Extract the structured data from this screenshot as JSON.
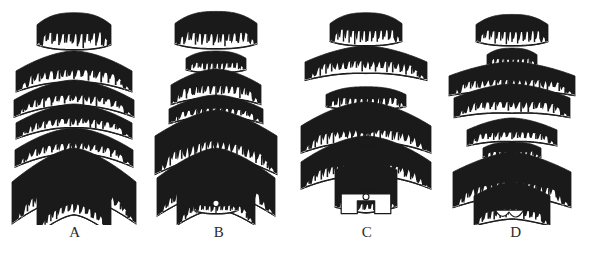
{
  "figure": {
    "kind": "scientific-line-illustration",
    "background_color": "#ffffff",
    "ink_color": "#1a1a1a",
    "enamel_color": "#ffffff",
    "width": 590,
    "height": 257,
    "label_row_y": 231
  },
  "panels": [
    {
      "id": "panel-a",
      "label": "A",
      "center_x": 74,
      "label_x_center": 74,
      "element_count": 7,
      "elements": [
        {
          "index": 1,
          "shape": "trapezoid-cap",
          "y": 10,
          "w": 74,
          "h": 40,
          "arch": 8,
          "teeth": 12,
          "tooth_depth": 17,
          "tilt": 0
        },
        {
          "index": 2,
          "shape": "wide-chevron",
          "y": 51,
          "w": 116,
          "h": 34,
          "arch": 20,
          "teeth": 17,
          "tooth_depth": 13,
          "tilt": 0
        },
        {
          "index": 3,
          "shape": "wide-chevron",
          "y": 80,
          "w": 120,
          "h": 28,
          "arch": 20,
          "teeth": 18,
          "tooth_depth": 11,
          "tilt": 0
        },
        {
          "index": 4,
          "shape": "wide-chevron",
          "y": 104,
          "w": 116,
          "h": 26,
          "arch": 19,
          "teeth": 18,
          "tooth_depth": 10,
          "tilt": 0
        },
        {
          "index": 5,
          "shape": "wide-chevron",
          "y": 128,
          "w": 118,
          "h": 28,
          "arch": 22,
          "teeth": 18,
          "tooth_depth": 11,
          "tilt": 0
        },
        {
          "index": 6,
          "shape": "deep-chevron",
          "y": 148,
          "w": 124,
          "h": 48,
          "arch": 34,
          "teeth": 20,
          "tooth_depth": 13,
          "tilt": 0
        },
        {
          "index": 7,
          "shape": "narrow-chevron",
          "y": 170,
          "w": 74,
          "h": 46,
          "arch": 26,
          "teeth": 13,
          "tooth_depth": 12,
          "tilt": 0
        }
      ]
    },
    {
      "id": "panel-b",
      "label": "B",
      "center_x": 216,
      "label_x_center": 216,
      "element_count": 8,
      "elements": [
        {
          "index": 1,
          "shape": "trapezoid-cap",
          "y": 9,
          "w": 82,
          "h": 40,
          "arch": 7,
          "teeth": 14,
          "tooth_depth": 16,
          "tilt": 0
        },
        {
          "index": 2,
          "shape": "low-cap",
          "y": 49,
          "w": 60,
          "h": 24,
          "arch": 6,
          "teeth": 12,
          "tooth_depth": 10,
          "tilt": 0
        },
        {
          "index": 3,
          "shape": "wide-chevron",
          "y": 69,
          "w": 90,
          "h": 32,
          "arch": 16,
          "teeth": 15,
          "tooth_depth": 13,
          "tilt": 0
        },
        {
          "index": 4,
          "shape": "wide-chevron",
          "y": 95,
          "w": 94,
          "h": 24,
          "arch": 14,
          "teeth": 15,
          "tooth_depth": 9,
          "tilt": 0
        },
        {
          "index": 5,
          "shape": "broad-arch",
          "y": 110,
          "w": 122,
          "h": 46,
          "arch": 26,
          "teeth": 20,
          "tooth_depth": 15,
          "tilt": 0
        },
        {
          "index": 6,
          "shape": "deep-chevron",
          "y": 148,
          "w": 118,
          "h": 44,
          "arch": 30,
          "teeth": 19,
          "tooth_depth": 13,
          "tilt": 0
        },
        {
          "index": 7,
          "shape": "narrow-arch",
          "y": 170,
          "w": 78,
          "h": 40,
          "arch": 22,
          "teeth": 14,
          "tooth_depth": 11,
          "tilt": 0
        },
        {
          "index": 8,
          "shape": "ring-arch",
          "y": 186,
          "w": 44,
          "h": 28,
          "arch": 12,
          "teeth": 9,
          "tooth_depth": 8,
          "tilt": 0,
          "inner_marking": "small-white-ring"
        }
      ]
    },
    {
      "id": "panel-c",
      "label": "C",
      "center_x": 366,
      "label_x_center": 366,
      "element_count": 6,
      "elements": [
        {
          "index": 1,
          "shape": "trapezoid-cap",
          "y": 10,
          "w": 72,
          "h": 36,
          "arch": 8,
          "teeth": 13,
          "tooth_depth": 16,
          "tilt": 0
        },
        {
          "index": 2,
          "shape": "wide-chevron",
          "y": 46,
          "w": 122,
          "h": 30,
          "arch": 16,
          "teeth": 20,
          "tooth_depth": 13,
          "tilt": 0
        },
        {
          "index": 3,
          "shape": "low-cap",
          "y": 84,
          "w": 80,
          "h": 26,
          "arch": 8,
          "teeth": 14,
          "tooth_depth": 12,
          "tilt": 0
        },
        {
          "index": 4,
          "shape": "winged-chevron",
          "y": 102,
          "w": 130,
          "h": 44,
          "arch": 24,
          "teeth": 22,
          "tooth_depth": 13,
          "tilt": 0,
          "inner_marking": "black-oval"
        },
        {
          "index": 5,
          "shape": "winged-chevron",
          "y": 136,
          "w": 130,
          "h": 44,
          "arch": 26,
          "teeth": 22,
          "tooth_depth": 13,
          "tilt": 0
        },
        {
          "index": 6,
          "shape": "lobed-stem",
          "y": 158,
          "w": 62,
          "h": 58,
          "arch": 10,
          "teeth": 12,
          "tooth_depth": 9,
          "tilt": 0,
          "inner_marking": "small-white-ring"
        }
      ]
    },
    {
      "id": "panel-d",
      "label": "D",
      "center_x": 512,
      "label_x_center": 512,
      "element_count": 8,
      "elements": [
        {
          "index": 1,
          "shape": "trapezoid-cap",
          "y": 12,
          "w": 72,
          "h": 34,
          "arch": 7,
          "teeth": 13,
          "tooth_depth": 15,
          "tilt": 0
        },
        {
          "index": 2,
          "shape": "low-cap",
          "y": 46,
          "w": 50,
          "h": 22,
          "arch": 6,
          "teeth": 10,
          "tooth_depth": 9,
          "tilt": 0
        },
        {
          "index": 3,
          "shape": "winged-chevron",
          "y": 62,
          "w": 126,
          "h": 32,
          "arch": 14,
          "teeth": 20,
          "tooth_depth": 12,
          "tilt": -4
        },
        {
          "index": 4,
          "shape": "winged-chevron",
          "y": 84,
          "w": 116,
          "h": 32,
          "arch": 14,
          "teeth": 18,
          "tooth_depth": 12,
          "tilt": 4
        },
        {
          "index": 5,
          "shape": "wide-chevron",
          "y": 118,
          "w": 90,
          "h": 26,
          "arch": 12,
          "teeth": 15,
          "tooth_depth": 10,
          "tilt": 3
        },
        {
          "index": 6,
          "shape": "low-cap",
          "y": 140,
          "w": 58,
          "h": 20,
          "arch": 6,
          "teeth": 11,
          "tooth_depth": 8,
          "tilt": 0
        },
        {
          "index": 7,
          "shape": "broad-arch",
          "y": 152,
          "w": 118,
          "h": 44,
          "arch": 20,
          "teeth": 19,
          "tooth_depth": 14,
          "tilt": 0
        },
        {
          "index": 8,
          "shape": "lobed-chevron",
          "y": 182,
          "w": 76,
          "h": 38,
          "arch": 14,
          "teeth": 13,
          "tooth_depth": 11,
          "tilt": 0,
          "inner_marking": "three-lobe-notch"
        }
      ]
    }
  ]
}
